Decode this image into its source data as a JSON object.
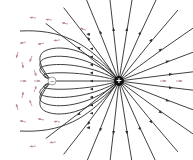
{
  "diagram": {
    "width": 193,
    "height": 160,
    "background": "#ffffff",
    "colors": {
      "field_line": "#2b2b2b",
      "vector_arrow": "#b9888c",
      "charge_positive_fill": "#111111",
      "charge_negative_fill": "#ffffff"
    },
    "charges": [
      {
        "id": "positive",
        "label": "+",
        "x": 119,
        "y": 81,
        "r": 5,
        "sign": "positive",
        "icon": "plus-charge-icon"
      },
      {
        "id": "negative",
        "label": "−",
        "x": 52,
        "y": 81,
        "r": 4,
        "sign": "negative",
        "icon": "minus-charge-icon"
      }
    ],
    "radial_lines": {
      "count": 20,
      "direction": "outward-from-positive"
    },
    "connecting_lines": {
      "count": 9,
      "direction": "positive-to-negative"
    },
    "field_vectors": {
      "description": "small pinkish arrows showing field direction in the region left of the negative charge",
      "count": 22
    }
  }
}
